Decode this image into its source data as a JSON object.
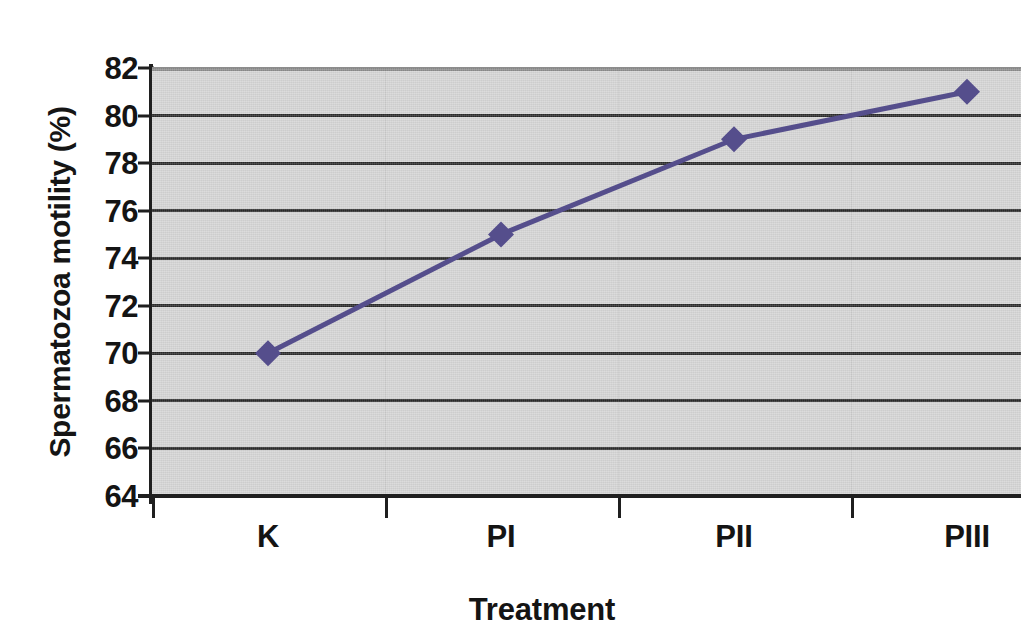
{
  "chart_data": {
    "type": "line",
    "title": "",
    "xlabel": "Treatment",
    "ylabel": "Spermatozoa motility (%)",
    "categories": [
      "K",
      "PI",
      "PII",
      "PIII"
    ],
    "values": [
      70,
      75,
      79,
      81
    ],
    "series": [
      {
        "name": "Spermatozoa motility",
        "values": [
          70,
          75,
          79,
          81
        ],
        "color": "#554e8c",
        "marker": "diamond",
        "line_width": 5
      }
    ],
    "ylim": [
      64,
      82
    ],
    "y_ticks": [
      64,
      66,
      68,
      70,
      72,
      74,
      76,
      78,
      80,
      82
    ],
    "y_tick_labels": [
      "64",
      "66",
      "68",
      "70",
      "72",
      "74",
      "76",
      "78",
      "80",
      "82"
    ],
    "grid": "horizontal",
    "legend": "none",
    "plot_background": "#d5d5d5",
    "gridline_color": "#2b2b2b",
    "axis_color": "#1f1f1f",
    "text_color": "#141414",
    "note": "right edge of plot area is cropped by the image border"
  },
  "axes": {
    "y_title": "Spermatozoa motility (%)",
    "x_title": "Treatment"
  },
  "y_ticks": [
    {
      "label": "82",
      "value": 82
    },
    {
      "label": "80",
      "value": 80
    },
    {
      "label": "78",
      "value": 78
    },
    {
      "label": "76",
      "value": 76
    },
    {
      "label": "74",
      "value": 74
    },
    {
      "label": "72",
      "value": 72
    },
    {
      "label": "70",
      "value": 70
    },
    {
      "label": "68",
      "value": 68
    },
    {
      "label": "66",
      "value": 66
    },
    {
      "label": "64",
      "value": 64
    }
  ],
  "x_categories": [
    {
      "label": "K",
      "value": 70
    },
    {
      "label": "PI",
      "value": 75
    },
    {
      "label": "PII",
      "value": 79
    },
    {
      "label": "PIII",
      "value": 81
    }
  ]
}
